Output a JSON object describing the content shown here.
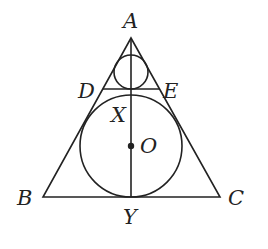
{
  "diagram": {
    "type": "geometry",
    "colors": {
      "stroke": "#222222",
      "background": "#ffffff"
    },
    "labels": {
      "A": "A",
      "B": "B",
      "C": "C",
      "D": "D",
      "E": "E",
      "X": "X",
      "O": "O",
      "Y": "Y"
    },
    "points": {
      "A": [
        131,
        38
      ],
      "B": [
        43,
        197
      ],
      "C": [
        220,
        197
      ],
      "D": [
        105,
        89
      ],
      "E": [
        158,
        89
      ],
      "X": [
        131,
        95
      ],
      "O": [
        131,
        146
      ],
      "Y": [
        131,
        197
      ]
    },
    "circles": [
      {
        "name": "incircle",
        "center": "O",
        "radius": 51
      },
      {
        "name": "small-circle",
        "center": [
          131,
          72
        ],
        "radius": 17
      }
    ],
    "segments": [
      "AB",
      "AC",
      "BC",
      "DE",
      "AY"
    ]
  }
}
